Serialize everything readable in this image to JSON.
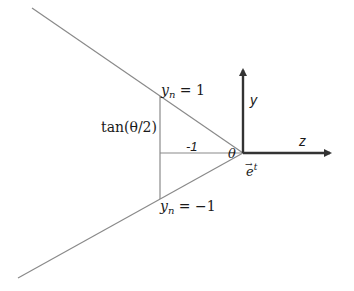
{
  "diagram": {
    "colors": {
      "lines": "#8a8a8a",
      "axes": "#333333",
      "text": "#1a1a1a"
    },
    "labels": {
      "yn_top": "y",
      "yn_top_sub": "n",
      "yn_top_eq": " = 1",
      "yn_bottom": "y",
      "yn_bottom_sub": "n",
      "yn_bottom_eq": " = −1",
      "tan": "tan(θ/2)",
      "minus_one": "-1",
      "theta": "θ",
      "e_vec": "e",
      "e_sup": "t",
      "e_arrow": "→",
      "axis_y": "y",
      "axis_z": "z"
    }
  }
}
